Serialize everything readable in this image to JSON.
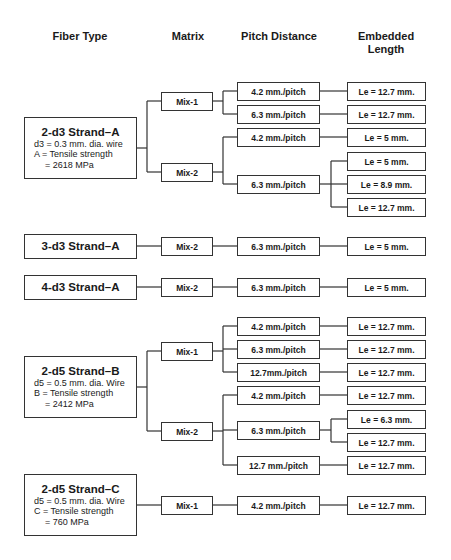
{
  "headers": {
    "fiber_type": "Fiber Type",
    "matrix": "Matrix",
    "pitch_distance": "Pitch Distance",
    "embedded_length_1": "Embedded",
    "embedded_length_2": "Length"
  },
  "fibers": [
    {
      "title": "2-d3 Strand–A",
      "line1": "d3 = 0.3 mm. dia. wire",
      "line2": "A = Tensile strength",
      "line3": "= 2618 MPa",
      "matrices": [
        {
          "label": "Mix-1",
          "pitches": [
            {
              "label": "4.2 mm./pitch",
              "lengths": [
                "Le = 12.7 mm."
              ]
            },
            {
              "label": "6.3 mm./pitch",
              "lengths": [
                "Le = 12.7 mm."
              ]
            }
          ]
        },
        {
          "label": "Mix-2",
          "pitches": [
            {
              "label": "4.2 mm./pitch",
              "lengths": [
                "Le = 5 mm."
              ]
            },
            {
              "label": "6.3 mm./pitch",
              "lengths": [
                "Le = 5 mm.",
                "Le = 8.9 mm.",
                "Le = 12.7 mm."
              ]
            }
          ]
        }
      ]
    },
    {
      "title": "3-d3 Strand–A",
      "matrices": [
        {
          "label": "Mix-2",
          "pitches": [
            {
              "label": "6.3 mm./pitch",
              "lengths": [
                "Le = 5 mm."
              ]
            }
          ]
        }
      ]
    },
    {
      "title": "4-d3 Strand–A",
      "matrices": [
        {
          "label": "Mix-2",
          "pitches": [
            {
              "label": "6.3 mm./pitch",
              "lengths": [
                "Le = 5 mm."
              ]
            }
          ]
        }
      ]
    },
    {
      "title": "2-d5 Strand–B",
      "line1": "d5 = 0.5 mm. dia. Wire",
      "line2": "B = Tensile strength",
      "line3": "= 2412 MPa",
      "matrices": [
        {
          "label": "Mix-1",
          "pitches": [
            {
              "label": "4.2 mm./pitch",
              "lengths": [
                "Le = 12.7 mm."
              ]
            },
            {
              "label": "6.3 mm./pitch",
              "lengths": [
                "Le = 12.7 mm."
              ]
            },
            {
              "label": "12.7mm./pitch",
              "lengths": [
                "Le = 12.7 mm."
              ]
            }
          ]
        },
        {
          "label": "Mix-2",
          "pitches": [
            {
              "label": "4.2 mm./pitch",
              "lengths": [
                "Le = 12.7 mm."
              ]
            },
            {
              "label": "6.3 mm./pitch",
              "lengths": [
                "Le = 6.3 mm.",
                "Le = 12.7 mm."
              ]
            },
            {
              "label": "12.7 mm./pitch",
              "lengths": [
                "Le = 12.7 mm."
              ]
            }
          ]
        }
      ]
    },
    {
      "title": "2-d5 Strand–C",
      "line1": "d5 = 0.5 mm. dia. Wire",
      "line2": "C = Tensile strength",
      "line3": "= 760 MPa",
      "matrices": [
        {
          "label": "Mix-1",
          "pitches": [
            {
              "label": "4.2 mm./pitch",
              "lengths": [
                "Le = 12.7 mm."
              ]
            }
          ]
        }
      ]
    }
  ]
}
